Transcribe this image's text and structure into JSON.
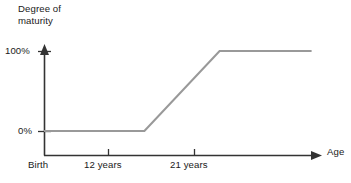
{
  "chart_data": {
    "type": "line",
    "title": "",
    "subtitle": "",
    "xlabel": "Age",
    "ylabel": "Degree of\nmaturity",
    "ylabel_line1": "Degree of",
    "ylabel_line2": "maturity",
    "x_tick_labels": [
      "Birth",
      "12 years",
      "21 years"
    ],
    "x_tick_values": [
      0,
      12,
      21
    ],
    "y_tick_labels": [
      "0%",
      "100%"
    ],
    "y_tick_values": [
      0,
      100
    ],
    "xlim": [
      0,
      33
    ],
    "ylim": [
      0,
      113
    ],
    "grid": false,
    "legend": false,
    "legend_position": "none",
    "axis_arrows": true,
    "series": [
      {
        "name": "Degree of maturity",
        "color": "#999999",
        "points": [
          {
            "x": 0,
            "y": 0,
            "x_label": "Birth",
            "y_label": "0%"
          },
          {
            "x": 12,
            "y": 0,
            "x_label": "12 years",
            "y_label": "0%"
          },
          {
            "x": 21,
            "y": 100,
            "x_label": "21 years",
            "y_label": "100%"
          },
          {
            "x": 32,
            "y": 100,
            "x_label": "",
            "y_label": "100%"
          }
        ]
      }
    ],
    "annotations": []
  },
  "style": {
    "axis_color": "#333333",
    "line_color": "#999999",
    "text_color": "#1a1a1a",
    "background": "#ffffff"
  },
  "geometry": {
    "y_axis_x": 44,
    "x_axis_y": 155,
    "y_100_px": 51,
    "y_0_px": 131,
    "x_birth_px": 44,
    "x_12_px": 108,
    "x_21_px": 194,
    "x_end_px": 320,
    "y_top_px": 48
  }
}
